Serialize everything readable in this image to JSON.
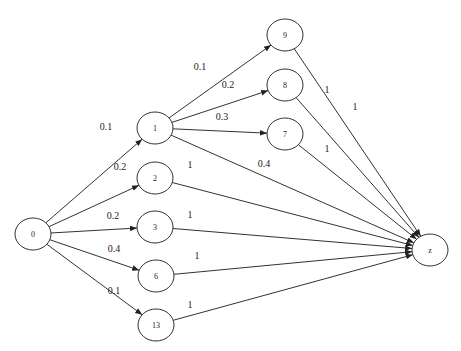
{
  "diagram": {
    "type": "directed-weighted-graph",
    "nodes": [
      {
        "id": "0",
        "label": "0",
        "x": 33,
        "y": 234
      },
      {
        "id": "1",
        "label": "1",
        "x": 155,
        "y": 128
      },
      {
        "id": "2",
        "label": "2",
        "x": 155,
        "y": 178
      },
      {
        "id": "3",
        "label": "3",
        "x": 155,
        "y": 227
      },
      {
        "id": "6",
        "label": "6",
        "x": 156,
        "y": 276
      },
      {
        "id": "13",
        "label": "13",
        "x": 156,
        "y": 325
      },
      {
        "id": "9",
        "label": "9",
        "x": 285,
        "y": 35
      },
      {
        "id": "8",
        "label": "8",
        "x": 285,
        "y": 85
      },
      {
        "id": "7",
        "label": "7",
        "x": 285,
        "y": 134
      },
      {
        "id": "z",
        "label": "z",
        "x": 430,
        "y": 250
      }
    ],
    "edges": [
      {
        "from": "0",
        "to": "1",
        "weight": "0.1",
        "lx": 106,
        "ly": 130
      },
      {
        "from": "0",
        "to": "2",
        "weight": "0.2",
        "lx": 120,
        "ly": 170
      },
      {
        "from": "0",
        "to": "3",
        "weight": "0.2",
        "lx": 113,
        "ly": 219
      },
      {
        "from": "0",
        "to": "6",
        "weight": "0.4",
        "lx": 114,
        "ly": 252
      },
      {
        "from": "0",
        "to": "13",
        "weight": "0.1",
        "lx": 114,
        "ly": 294
      },
      {
        "from": "1",
        "to": "9",
        "weight": "0.1",
        "lx": 200,
        "ly": 70
      },
      {
        "from": "1",
        "to": "8",
        "weight": "0.2",
        "lx": 228,
        "ly": 88
      },
      {
        "from": "1",
        "to": "7",
        "weight": "0.3",
        "lx": 222,
        "ly": 120
      },
      {
        "from": "1",
        "to": "z",
        "weight": "0.4",
        "lx": 264,
        "ly": 167
      },
      {
        "from": "2",
        "to": "z",
        "weight": "1",
        "lx": 190,
        "ly": 168
      },
      {
        "from": "3",
        "to": "z",
        "weight": "1",
        "lx": 190,
        "ly": 218
      },
      {
        "from": "6",
        "to": "z",
        "weight": "1",
        "lx": 197,
        "ly": 259
      },
      {
        "from": "13",
        "to": "z",
        "weight": "1",
        "lx": 190,
        "ly": 308
      },
      {
        "from": "9",
        "to": "z",
        "weight": "1",
        "lx": 355,
        "ly": 110
      },
      {
        "from": "8",
        "to": "z",
        "weight": "1",
        "lx": 327,
        "ly": 93
      },
      {
        "from": "7",
        "to": "z",
        "weight": "1",
        "lx": 327,
        "ly": 152
      }
    ],
    "node_radius_x": 18,
    "node_radius_y": 16,
    "colors": {
      "stroke": "#333333",
      "background": "#ffffff",
      "text": "#222222"
    }
  }
}
